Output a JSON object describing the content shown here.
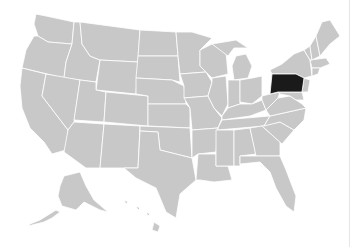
{
  "map": {
    "type": "choropleth",
    "region": "United States",
    "highlighted_state": "Pennsylvania",
    "colors": {
      "base": "#c8c8c8",
      "highlight": "#1a1a1a",
      "border": "#ffffff",
      "background": "#ffffff"
    }
  }
}
